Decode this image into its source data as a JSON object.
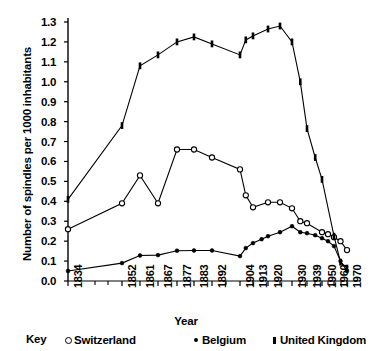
{
  "chart_data": {
    "type": "line",
    "title": "",
    "xlabel": "Year",
    "ylabel": "Number of spindles per 1000 inhabitants",
    "ylim": [
      0.0,
      1.3
    ],
    "ytick_step": 0.1,
    "yticks": [
      "1.3",
      "1.2",
      "1.1",
      "1.0",
      "0.9",
      "0.8",
      "0.7",
      "0.6",
      "0.5",
      "0.4",
      "0.3",
      "0.2",
      "0.1",
      "0.0"
    ],
    "grid": false,
    "legend_position": "bottom",
    "legend_title": "Key",
    "x_tick_labels": [
      "1834",
      "1852",
      "1861",
      "1867",
      "1877",
      "1883",
      "1892",
      "1904",
      "1913",
      "1920",
      "1930",
      "1939",
      "1950",
      "1960",
      "1970"
    ],
    "x_axis_note": "Unevenly spaced year categories; additional minor ticks appear between some labelled years",
    "series": [
      {
        "name": "Switzerland",
        "marker": "open-circle",
        "color": "#000000",
        "points": [
          {
            "x": 1834,
            "y": 0.26
          },
          {
            "x": 1852,
            "y": 0.39
          },
          {
            "x": 1861,
            "y": 0.53
          },
          {
            "x": 1867,
            "y": 0.39
          },
          {
            "x": 1877,
            "y": 0.66
          },
          {
            "x": 1883,
            "y": 0.66
          },
          {
            "x": 1892,
            "y": 0.62
          },
          {
            "x": 1904,
            "y": 0.56
          },
          {
            "x": 1908,
            "y": 0.43
          },
          {
            "x": 1913,
            "y": 0.37
          },
          {
            "x": 1920,
            "y": 0.395
          },
          {
            "x": 1925,
            "y": 0.395
          },
          {
            "x": 1930,
            "y": 0.365
          },
          {
            "x": 1935,
            "y": 0.3
          },
          {
            "x": 1939,
            "y": 0.29
          },
          {
            "x": 1950,
            "y": 0.245
          },
          {
            "x": 1955,
            "y": 0.235
          },
          {
            "x": 1960,
            "y": 0.22
          },
          {
            "x": 1965,
            "y": 0.2
          },
          {
            "x": 1970,
            "y": 0.155
          }
        ]
      },
      {
        "name": "Belgium",
        "marker": "filled-dot",
        "color": "#000000",
        "points": [
          {
            "x": 1834,
            "y": 0.05
          },
          {
            "x": 1852,
            "y": 0.09
          },
          {
            "x": 1861,
            "y": 0.128
          },
          {
            "x": 1867,
            "y": 0.13
          },
          {
            "x": 1877,
            "y": 0.152
          },
          {
            "x": 1883,
            "y": 0.153
          },
          {
            "x": 1892,
            "y": 0.153
          },
          {
            "x": 1904,
            "y": 0.125
          },
          {
            "x": 1908,
            "y": 0.165
          },
          {
            "x": 1913,
            "y": 0.19
          },
          {
            "x": 1917,
            "y": 0.21
          },
          {
            "x": 1920,
            "y": 0.225
          },
          {
            "x": 1925,
            "y": 0.245
          },
          {
            "x": 1930,
            "y": 0.275
          },
          {
            "x": 1935,
            "y": 0.245
          },
          {
            "x": 1939,
            "y": 0.24
          },
          {
            "x": 1945,
            "y": 0.23
          },
          {
            "x": 1950,
            "y": 0.215
          },
          {
            "x": 1955,
            "y": 0.2
          },
          {
            "x": 1960,
            "y": 0.175
          },
          {
            "x": 1965,
            "y": 0.1
          },
          {
            "x": 1970,
            "y": 0.05
          }
        ]
      },
      {
        "name": "United Kingdom",
        "marker": "filled-bar",
        "color": "#000000",
        "points": [
          {
            "x": 1834,
            "y": 0.41
          },
          {
            "x": 1852,
            "y": 0.78
          },
          {
            "x": 1861,
            "y": 1.08
          },
          {
            "x": 1867,
            "y": 1.135
          },
          {
            "x": 1877,
            "y": 1.2
          },
          {
            "x": 1883,
            "y": 1.225
          },
          {
            "x": 1892,
            "y": 1.19
          },
          {
            "x": 1904,
            "y": 1.135
          },
          {
            "x": 1908,
            "y": 1.21
          },
          {
            "x": 1913,
            "y": 1.23
          },
          {
            "x": 1920,
            "y": 1.265
          },
          {
            "x": 1925,
            "y": 1.28
          },
          {
            "x": 1930,
            "y": 1.2
          },
          {
            "x": 1935,
            "y": 1.0
          },
          {
            "x": 1939,
            "y": 0.765
          },
          {
            "x": 1945,
            "y": 0.62
          },
          {
            "x": 1950,
            "y": 0.51
          },
          {
            "x": 1960,
            "y": 0.225
          },
          {
            "x": 1965,
            "y": 0.095
          },
          {
            "x": 1970,
            "y": 0.065
          }
        ]
      }
    ]
  },
  "axis": {
    "ylabel": "Number of spindles per 1000 inhabitants",
    "xlabel": "Year"
  },
  "key": {
    "label": "Key",
    "entries": [
      {
        "symbol": "open-circle",
        "label": "Switzerland"
      },
      {
        "symbol": "filled-dot",
        "label": "Belgium"
      },
      {
        "symbol": "filled-bar",
        "label": "United Kingdom"
      }
    ]
  }
}
